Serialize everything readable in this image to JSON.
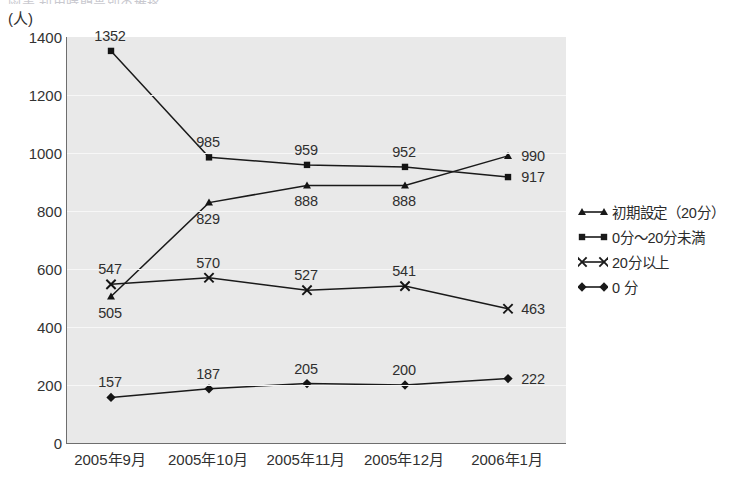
{
  "header": {
    "clipped_text": "図表 利用時間帯別の推移"
  },
  "axis": {
    "unit_label": "(人)",
    "y_ticks": [
      "1400",
      "1200",
      "1000",
      "800",
      "600",
      "400",
      "200",
      "0"
    ]
  },
  "legend": {
    "items": [
      {
        "label": "初期設定（20分）",
        "marker": "triangle-marker",
        "color": "#1a1a1a"
      },
      {
        "label": "0分〜20分未満",
        "marker": "square-marker",
        "color": "#1a1a1a"
      },
      {
        "label": "20分以上",
        "marker": "cross-marker",
        "color": "#1a1a1a"
      },
      {
        "label": "0 分",
        "marker": "diamond-marker",
        "color": "#1a1a1a"
      }
    ]
  },
  "chart_data": {
    "type": "line",
    "title": "",
    "xlabel": "",
    "ylabel": "(人)",
    "ylim": [
      0,
      1400
    ],
    "ytick_step": 200,
    "grid": true,
    "legend_position": "right",
    "categories": [
      "2005年9月",
      "2005年10月",
      "2005年11月",
      "2005年12月",
      "2006年1月"
    ],
    "series": [
      {
        "name": "初期設定（20分）",
        "marker": "triangle",
        "values": [
          505,
          829,
          888,
          888,
          990
        ],
        "label_positions": [
          "below",
          "below",
          "below",
          "below",
          "right"
        ]
      },
      {
        "name": "0分〜20分未満",
        "marker": "square",
        "values": [
          1352,
          985,
          959,
          952,
          917
        ],
        "label_positions": [
          "above",
          "above",
          "above",
          "above",
          "right"
        ]
      },
      {
        "name": "20分以上",
        "marker": "cross",
        "values": [
          547,
          570,
          527,
          541,
          463
        ],
        "label_positions": [
          "above",
          "above",
          "above",
          "above",
          "right"
        ]
      },
      {
        "name": "0 分",
        "marker": "diamond",
        "values": [
          157,
          187,
          205,
          200,
          222
        ],
        "label_positions": [
          "above",
          "above",
          "above",
          "above",
          "right"
        ]
      }
    ]
  }
}
